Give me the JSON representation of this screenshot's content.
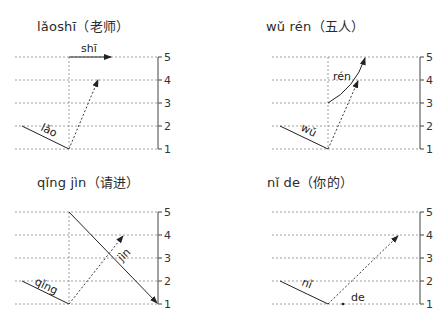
{
  "scale": {
    "levels": [
      "5",
      "4",
      "3",
      "2",
      "1"
    ]
  },
  "diagrams": [
    {
      "id": "laoshi",
      "title_pinyin": "lǎoshī",
      "title_hanzi": "（老师）",
      "syllables": [
        {
          "text": "lǎo",
          "tone": "third-sandhi-half",
          "from": 2,
          "to": 1
        },
        {
          "text": "shī",
          "tone": "first",
          "from": 5,
          "to": 5
        }
      ],
      "original_tone_arrow": {
        "from": 1,
        "to": 4,
        "style": "dashed"
      }
    },
    {
      "id": "wuren",
      "title_pinyin": "wǔ rén",
      "title_hanzi": "（五人）",
      "syllables": [
        {
          "text": "wǔ",
          "tone": "third-sandhi-half",
          "from": 2,
          "to": 1
        },
        {
          "text": "rén",
          "tone": "second",
          "from": 3,
          "to": 5
        }
      ],
      "original_tone_arrow": {
        "from": 1,
        "to": 4,
        "style": "dashed"
      }
    },
    {
      "id": "qingjin",
      "title_pinyin": "qǐng jìn",
      "title_hanzi": "（请进）",
      "syllables": [
        {
          "text": "qǐng",
          "tone": "third-sandhi-half",
          "from": 2,
          "to": 1
        },
        {
          "text": "jìn",
          "tone": "fourth",
          "from": 5,
          "to": 1
        }
      ],
      "original_tone_arrow": {
        "from": 1,
        "to": 4,
        "style": "dashed"
      }
    },
    {
      "id": "nide",
      "title_pinyin": "nǐ de",
      "title_hanzi": "（你的）",
      "syllables": [
        {
          "text": "nǐ",
          "tone": "third-sandhi-half",
          "from": 2,
          "to": 1
        },
        {
          "text": "de",
          "tone": "neutral",
          "from": 1,
          "to": 1
        }
      ],
      "original_tone_arrow": {
        "from": 1,
        "to": 4,
        "style": "dashed"
      }
    }
  ]
}
